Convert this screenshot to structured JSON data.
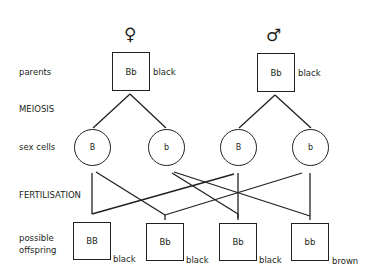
{
  "row_labels": {
    "parents": "parents",
    "meiosis": "MEIOSIS",
    "sex_cells": "sex cells",
    "fertilisation": "FERTILISATION",
    "offspring_line1": "possible",
    "offspring_line2": "offspring"
  },
  "parents": {
    "female": {
      "symbol": "♀",
      "genotype": "Bb",
      "phenotype": "black"
    },
    "male": {
      "symbol": "♂",
      "genotype": "Bb",
      "phenotype": "black"
    }
  },
  "sex_cells": [
    {
      "parent": "female",
      "allele": "B"
    },
    {
      "parent": "female",
      "allele": "b"
    },
    {
      "parent": "male",
      "allele": "B"
    },
    {
      "parent": "male",
      "allele": "b"
    }
  ],
  "offspring": [
    {
      "genotype": "BB",
      "phenotype": "black"
    },
    {
      "genotype": "Bb",
      "phenotype": "black"
    },
    {
      "genotype": "Bb",
      "phenotype": "black"
    },
    {
      "genotype": "bb",
      "phenotype": "brown"
    }
  ],
  "colors": {
    "ink": "#231f20",
    "background": "#ffffff"
  }
}
